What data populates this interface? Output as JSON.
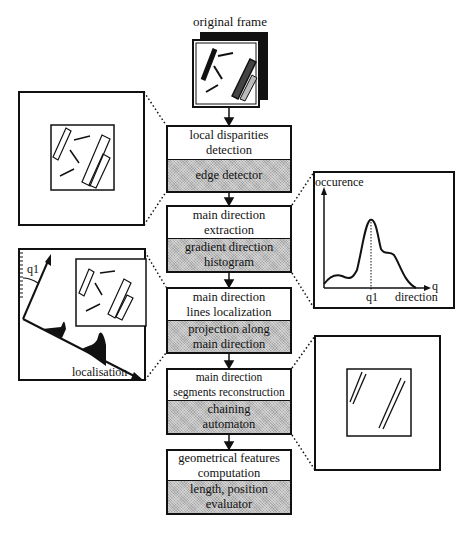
{
  "title": "original frame",
  "pipeline": [
    {
      "stage": "local disparities detection",
      "method": "edge detector"
    },
    {
      "stage": "main direction extraction",
      "method": "gradient direction histogram"
    },
    {
      "stage": "main direction lines localization",
      "method": "projection along main direction"
    },
    {
      "stage": "main direction segments reconstruction",
      "method": "chaining automaton"
    },
    {
      "stage": "geometrical features computation",
      "method": "length, position evaluator"
    }
  ],
  "labels": {
    "stage1_line1": "local disparities",
    "stage1_line2": "detection",
    "method1_line1": "edge detector",
    "stage2_line1": "main direction",
    "stage2_line2": "extraction",
    "method2_line1": "gradient direction",
    "method2_line2": "histogram",
    "stage3_line1": "main direction",
    "stage3_line2": "lines localization",
    "method3_line1": "projection along",
    "method3_line2": "main direction",
    "stage4_line1": "main direction",
    "stage4_line2": "segments reconstruction",
    "method4_line1": "chaining",
    "method4_line2": "automaton",
    "stage5_line1": "geometrical features",
    "stage5_line2": "computation",
    "method5_line1": "length, position",
    "method5_line2": "evaluator"
  },
  "histogram_panel": {
    "y_label": "occurence",
    "x_label": "direction",
    "x_axis_symbol": "q",
    "peak_label": "q1"
  },
  "projection_panel": {
    "angle_label": "q1",
    "axis_label": "localisation"
  },
  "colors": {
    "ink": "#111111",
    "method_fill": "#bdbdbd",
    "background": "#ffffff"
  }
}
